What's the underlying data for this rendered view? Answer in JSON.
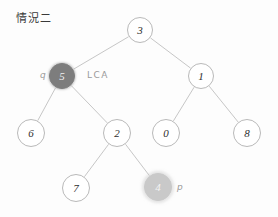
{
  "diagram": {
    "title": "情況二",
    "type": "binary-tree-lca",
    "canvas": {
      "width": 278,
      "height": 217,
      "background": "#fdfdfd"
    },
    "colors": {
      "node_stroke": "#b9b9b9",
      "node_fill": "#ffffff",
      "edge": "#c0c0c0",
      "text": "#2e2e2e",
      "lca_node_fill": "#7d7d7d",
      "target_node_fill": "#c9c9c9",
      "label": "#9a9a9a"
    },
    "nodes": [
      {
        "id": "n3",
        "label": "3",
        "x": 140,
        "y": 30,
        "r": 13,
        "style": "plain"
      },
      {
        "id": "n5",
        "label": "5",
        "x": 62,
        "y": 76,
        "r": 13,
        "style": "fill-dark"
      },
      {
        "id": "n1",
        "label": "1",
        "x": 201,
        "y": 76,
        "r": 13,
        "style": "plain"
      },
      {
        "id": "n6",
        "label": "6",
        "x": 31,
        "y": 133,
        "r": 14,
        "style": "plain"
      },
      {
        "id": "n2",
        "label": "2",
        "x": 117,
        "y": 133,
        "r": 14,
        "style": "plain"
      },
      {
        "id": "n0",
        "label": "0",
        "x": 166,
        "y": 133,
        "r": 14,
        "style": "plain"
      },
      {
        "id": "n8",
        "label": "8",
        "x": 247,
        "y": 133,
        "r": 14,
        "style": "plain"
      },
      {
        "id": "n7",
        "label": "7",
        "x": 76,
        "y": 188,
        "r": 14,
        "style": "plain"
      },
      {
        "id": "n4",
        "label": "4",
        "x": 158,
        "y": 187,
        "r": 14,
        "style": "fill-light"
      }
    ],
    "edges": [
      {
        "from": "n3",
        "to": "n5"
      },
      {
        "from": "n3",
        "to": "n1"
      },
      {
        "from": "n5",
        "to": "n6"
      },
      {
        "from": "n5",
        "to": "n2"
      },
      {
        "from": "n1",
        "to": "n0"
      },
      {
        "from": "n1",
        "to": "n8"
      },
      {
        "from": "n2",
        "to": "n7"
      },
      {
        "from": "n2",
        "to": "n4"
      }
    ],
    "annotations": [
      {
        "id": "a-q",
        "text": "q",
        "x": 40,
        "y": 70,
        "kind": "var"
      },
      {
        "id": "a-lca",
        "text": "LCA",
        "x": 87,
        "y": 70,
        "kind": "lca"
      },
      {
        "id": "a-p",
        "text": "p",
        "x": 177,
        "y": 182,
        "kind": "var"
      }
    ],
    "title_pos": {
      "x": 16,
      "y": 9
    }
  }
}
